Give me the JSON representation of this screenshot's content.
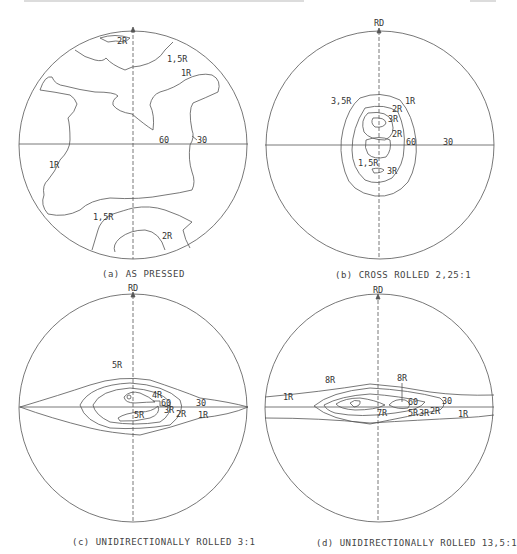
{
  "figure": {
    "panels": [
      {
        "id": "a",
        "caption": "(a) AS PRESSED",
        "axis_label": "",
        "ring_labels": {
          "inner": "60",
          "outer": "30"
        },
        "contour_labels": [
          "2R",
          "1,5R",
          "1R",
          "1R",
          "1,5R",
          "2R"
        ]
      },
      {
        "id": "b",
        "caption": "(b) CROSS ROLLED 2,25:1",
        "axis_label": "RD",
        "ring_labels": {
          "inner": "60",
          "outer": "30"
        },
        "contour_labels": [
          "3,5R",
          "1R",
          "2R",
          "3R",
          "2R",
          "1,5R",
          "3R"
        ]
      },
      {
        "id": "c",
        "caption": "(c) UNIDIRECTIONALLY ROLLED 3:1",
        "axis_label": "RD",
        "ring_labels": {
          "inner": "60",
          "outer": "30"
        },
        "contour_labels": [
          "5R",
          "4R",
          "3R",
          "2R",
          "1R",
          "5R"
        ]
      },
      {
        "id": "d",
        "caption": "(d) UNIDIRECTIONALLY ROLLED 13,5:1",
        "axis_label": "RD",
        "ring_labels": {
          "inner": "60",
          "outer": "30"
        },
        "contour_labels": [
          "8R",
          "8R",
          "1R",
          "7R",
          "5R",
          "3R",
          "2R",
          "1R"
        ]
      }
    ]
  },
  "colors": {
    "line": "#555555",
    "text": "#333333",
    "background": "#ffffff"
  }
}
